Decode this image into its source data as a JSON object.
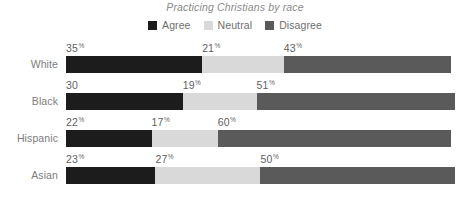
{
  "chart_data": {
    "type": "bar",
    "subtype": "stacked-horizontal-100",
    "title": "Practicing Christians by race",
    "xlabel": "",
    "ylabel": "",
    "grid": false,
    "legend_position": "top-center",
    "xlim": [
      0,
      100
    ],
    "categories": [
      "White",
      "Black",
      "Hispanic",
      "Asian"
    ],
    "series": [
      {
        "name": "Agree",
        "color": "#1c1c1c",
        "values": [
          35,
          30,
          22,
          23
        ]
      },
      {
        "name": "Neutral",
        "color": "#d9d9d9",
        "values": [
          21,
          19,
          17,
          27
        ]
      },
      {
        "name": "Disagree",
        "color": "#5a5a5a",
        "values": [
          43,
          51,
          60,
          50
        ]
      }
    ],
    "value_labels": [
      [
        "35%",
        "21%",
        "43%"
      ],
      [
        "30",
        "19%",
        "51%"
      ],
      [
        "22%",
        "17%",
        "60%"
      ],
      [
        "23%",
        "27%",
        "50%"
      ]
    ]
  },
  "colors": {
    "agree": "#1c1c1c",
    "neutral": "#d9d9d9",
    "disagree": "#5a5a5a",
    "title_text": "#8a8a8a",
    "label_text": "#7d7d7d",
    "value_text": "#5f5f5f",
    "background": "#ffffff"
  },
  "title": "Practicing Christians by race",
  "legend": {
    "items": [
      {
        "label": "Agree"
      },
      {
        "label": "Neutral"
      },
      {
        "label": "Disagree"
      }
    ]
  },
  "rows": [
    {
      "label": "White",
      "segments": [
        {
          "series": "Agree",
          "value": 35,
          "label_number": "35",
          "label_pct": "%"
        },
        {
          "series": "Neutral",
          "value": 21,
          "label_number": "21",
          "label_pct": "%"
        },
        {
          "series": "Disagree",
          "value": 43,
          "label_number": "43",
          "label_pct": "%"
        }
      ]
    },
    {
      "label": "Black",
      "segments": [
        {
          "series": "Agree",
          "value": 30,
          "label_number": "30",
          "label_pct": ""
        },
        {
          "series": "Neutral",
          "value": 19,
          "label_number": "19",
          "label_pct": "%"
        },
        {
          "series": "Disagree",
          "value": 51,
          "label_number": "51",
          "label_pct": "%"
        }
      ]
    },
    {
      "label": "Hispanic",
      "segments": [
        {
          "series": "Agree",
          "value": 22,
          "label_number": "22",
          "label_pct": "%"
        },
        {
          "series": "Neutral",
          "value": 17,
          "label_number": "17",
          "label_pct": "%"
        },
        {
          "series": "Disagree",
          "value": 60,
          "label_number": "60",
          "label_pct": "%"
        }
      ]
    },
    {
      "label": "Asian",
      "segments": [
        {
          "series": "Agree",
          "value": 23,
          "label_number": "23",
          "label_pct": "%"
        },
        {
          "series": "Neutral",
          "value": 27,
          "label_number": "27",
          "label_pct": "%"
        },
        {
          "series": "Disagree",
          "value": 50,
          "label_number": "50",
          "label_pct": "%"
        }
      ]
    }
  ]
}
